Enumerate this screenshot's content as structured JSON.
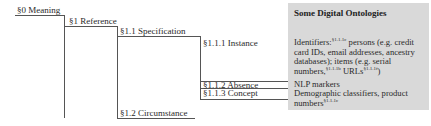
{
  "diagram": {
    "nodes": [
      {
        "id": "s0",
        "label": "§0 Meaning"
      },
      {
        "id": "s1",
        "label": "§1 Reference"
      },
      {
        "id": "s1_1",
        "label": "§1.1 Specification"
      },
      {
        "id": "s1_1_1",
        "label": "§1.1.1 Instance"
      },
      {
        "id": "s1_1_2",
        "label": "§1.1.2 Absence"
      },
      {
        "id": "s1_1_3",
        "label": "§1.1.3 Concept"
      },
      {
        "id": "s1_2",
        "label": "§1.2 Circumstance"
      }
    ],
    "panel": {
      "title": "Some Digital Ontologies",
      "instance": {
        "prefix": "Identifiers:",
        "sup1": "§1.1.1c",
        "text1": " persons (e.g. credit card IDs, email addresses, ancestry databases); items (e.g. serial numbers,",
        "sup2": "§1.1.1b",
        "text2": " URLs",
        "sup3": "§1.1.1f",
        "suffix": ")"
      },
      "absence": "NLP markers",
      "concept": {
        "text": "Demographic classifiers, product numbers",
        "sup": "§1.1.1c"
      }
    }
  }
}
